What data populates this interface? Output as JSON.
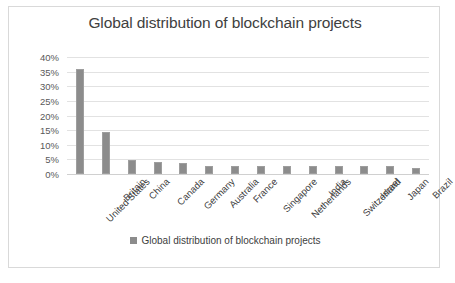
{
  "chart_data": {
    "type": "bar",
    "title": "Global distribution of blockchain projects",
    "xlabel": "",
    "ylabel": "",
    "ylim": [
      0,
      40
    ],
    "ytick_step": 5,
    "ytick_labels": [
      "40%",
      "35%",
      "30%",
      "25%",
      "20%",
      "15%",
      "10%",
      "5%",
      "0%"
    ],
    "ytick_values": [
      40,
      35,
      30,
      25,
      20,
      15,
      10,
      5,
      0
    ],
    "grid": true,
    "legend_position": "bottom",
    "legend": [
      "Global distribution of blockchain projects"
    ],
    "series_name": "Global distribution of blockchain projects",
    "bar_color": "#8c8c8c",
    "categories": [
      "United States",
      "Britain",
      "China",
      "Canada",
      "Germany",
      "Australia",
      "France",
      "Singapore",
      "Netherlands",
      "India",
      "Switzerland",
      "Israel",
      "Japan",
      "Brazil"
    ],
    "values": [
      36,
      14.5,
      4.7,
      4.0,
      3.6,
      2.7,
      2.7,
      2.7,
      2.8,
      2.7,
      2.6,
      2.6,
      2.6,
      2.2
    ],
    "value_unit": "%"
  },
  "legend_row": {
    "swatch_name": "legend-color-swatch",
    "label": "Global distribution of blockchain projects"
  }
}
